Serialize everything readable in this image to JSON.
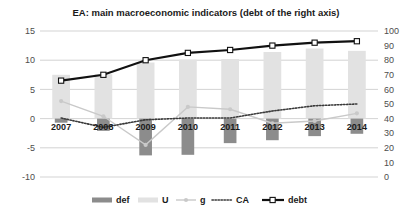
{
  "chart_data": {
    "type": "bar",
    "title": "EA: main macroeconomic indicators (debt of the right axis)",
    "xlabel": "",
    "ylabel": "",
    "categories": [
      "2007",
      "2008",
      "2009",
      "2010",
      "2011",
      "2012",
      "2013",
      "2014"
    ],
    "left_axis": {
      "min": -10,
      "max": 15,
      "ticks": [
        "15",
        "10",
        "5",
        "0",
        "-5",
        "-10"
      ],
      "tick_values": [
        15,
        10,
        5,
        0,
        -5,
        -10
      ]
    },
    "right_axis": {
      "min": 0,
      "max": 100,
      "ticks": [
        "100",
        "90",
        "80",
        "70",
        "60",
        "50",
        "40",
        "30",
        "20",
        "10",
        "0"
      ],
      "tick_values": [
        100,
        90,
        80,
        70,
        60,
        50,
        40,
        30,
        20,
        10,
        0
      ]
    },
    "grid": true,
    "legend_position": "bottom",
    "series": [
      {
        "name": "def",
        "label": "def",
        "type": "bar",
        "axis": "left",
        "color": "#8c8c8c",
        "values": [
          -0.7,
          -2.1,
          -6.3,
          -6.2,
          -4.2,
          -3.7,
          -3.0,
          -2.6
        ]
      },
      {
        "name": "U",
        "label": "U",
        "type": "bar",
        "axis": "left",
        "color": "#e2e2e2",
        "values": [
          7.5,
          7.6,
          9.6,
          10.1,
          10.2,
          11.4,
          12.0,
          11.6
        ]
      },
      {
        "name": "g",
        "label": "g",
        "type": "line",
        "axis": "left",
        "color": "#c9c9c9",
        "marker": "circle",
        "values": [
          3.0,
          0.4,
          -4.5,
          2.0,
          1.6,
          -0.8,
          -0.4,
          0.9
        ]
      },
      {
        "name": "CA",
        "label": "CA",
        "type": "line-dotted",
        "axis": "left",
        "color": "#3a3a3a",
        "values": [
          0.1,
          -1.5,
          -0.2,
          0.1,
          0.1,
          1.3,
          2.2,
          2.5
        ]
      },
      {
        "name": "debt",
        "label": "debt",
        "type": "line-marker",
        "axis": "right",
        "color": "#111111",
        "marker": "square",
        "values": [
          66,
          70,
          80,
          85,
          87,
          90,
          92,
          93
        ]
      }
    ]
  },
  "legend": {
    "items": [
      {
        "label": "def",
        "kind": "bar",
        "color": "#8c8c8c"
      },
      {
        "label": "U",
        "kind": "bar",
        "color": "#e2e2e2"
      },
      {
        "label": "g",
        "kind": "line-circle",
        "color": "#c9c9c9"
      },
      {
        "label": "CA",
        "kind": "line-dotted",
        "color": "#3a3a3a"
      },
      {
        "label": "debt",
        "kind": "line-square",
        "color": "#111111"
      }
    ]
  }
}
